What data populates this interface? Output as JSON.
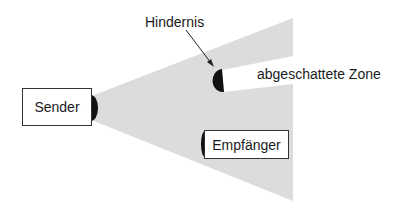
{
  "diagram": {
    "sender": {
      "label": "Sender"
    },
    "receiver": {
      "label": "Empfänger"
    },
    "obstacle": {
      "label": "Hindernis"
    },
    "shadow_zone": {
      "label": "abgeschattete Zone"
    },
    "colors": {
      "beam": "#dcdcdc",
      "antenna": "#111111",
      "box_border": "#333333",
      "text": "#1a1a1a"
    }
  }
}
